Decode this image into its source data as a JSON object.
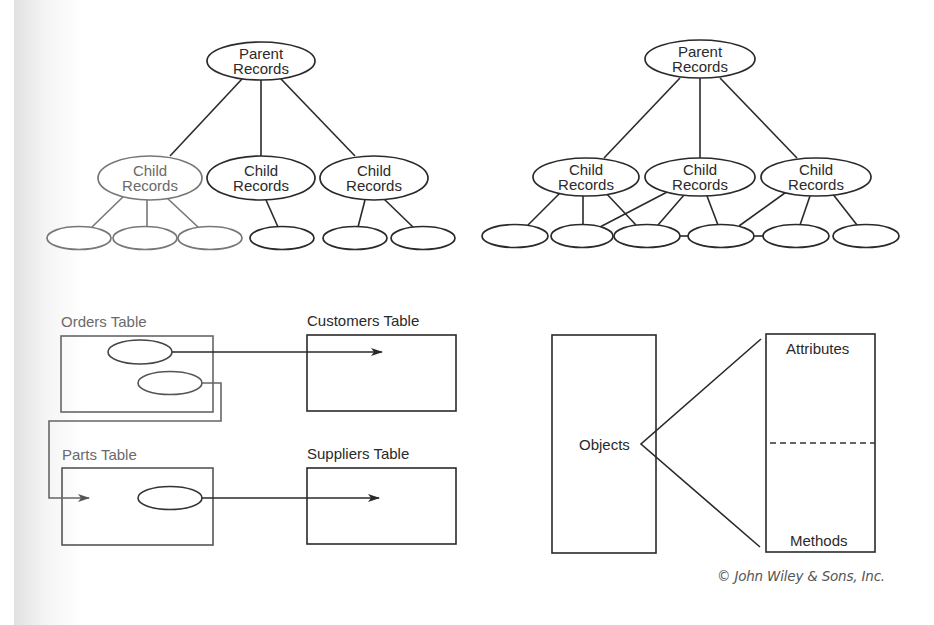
{
  "hierarchical_model": {
    "parent": {
      "line1": "Parent",
      "line2": "Records",
      "cx": 261,
      "cy": 61,
      "rx": 54,
      "ry": 19
    },
    "children": [
      {
        "line1": "Child",
        "line2": "Records",
        "cx": 150,
        "cy": 178,
        "rx": 52,
        "ry": 22
      },
      {
        "line1": "Child",
        "line2": "Records",
        "cx": 261,
        "cy": 178,
        "rx": 54,
        "ry": 22
      },
      {
        "line1": "Child",
        "line2": "Records",
        "cx": 374,
        "cy": 178,
        "rx": 54,
        "ry": 22
      }
    ],
    "leaves": [
      {
        "cx": 79,
        "cy": 238,
        "rx": 32,
        "ry": 11.5
      },
      {
        "cx": 145,
        "cy": 238,
        "rx": 32,
        "ry": 11.5
      },
      {
        "cx": 210,
        "cy": 238,
        "rx": 32,
        "ry": 11.5
      },
      {
        "cx": 282,
        "cy": 238,
        "rx": 32,
        "ry": 11.5
      },
      {
        "cx": 355,
        "cy": 238,
        "rx": 32,
        "ry": 11.5
      },
      {
        "cx": 423,
        "cy": 238,
        "rx": 32,
        "ry": 11.5
      }
    ],
    "edges": [
      [
        242,
        79,
        170,
        156
      ],
      [
        261,
        80,
        261,
        156
      ],
      [
        281,
        79,
        355,
        156
      ],
      [
        126,
        194,
        92,
        227
      ],
      [
        147,
        200,
        147,
        227
      ],
      [
        167,
        198,
        198,
        227
      ],
      [
        266,
        200,
        278,
        227
      ],
      [
        365,
        200,
        358,
        227
      ],
      [
        384,
        199,
        413,
        227
      ]
    ]
  },
  "network_model": {
    "parent": {
      "line1": "Parent",
      "line2": "Records",
      "cx": 700,
      "cy": 59,
      "rx": 55,
      "ry": 19
    },
    "children": [
      {
        "line1": "Child",
        "line2": "Records",
        "cx": 586,
        "cy": 177,
        "rx": 53,
        "ry": 19
      },
      {
        "line1": "Child",
        "line2": "Records",
        "cx": 700,
        "cy": 177,
        "rx": 55,
        "ry": 19
      },
      {
        "line1": "Child",
        "line2": "Records",
        "cx": 816,
        "cy": 177,
        "rx": 55,
        "ry": 19
      }
    ],
    "leaves": [
      {
        "cx": 515,
        "cy": 236,
        "rx": 33,
        "ry": 11.5
      },
      {
        "cx": 582,
        "cy": 236,
        "rx": 31,
        "ry": 11.5
      },
      {
        "cx": 647,
        "cy": 236,
        "rx": 33,
        "ry": 11.5
      },
      {
        "cx": 721,
        "cy": 236,
        "rx": 33,
        "ry": 11.5
      },
      {
        "cx": 796,
        "cy": 236,
        "rx": 33,
        "ry": 11.5
      },
      {
        "cx": 866,
        "cy": 236,
        "rx": 33,
        "ry": 11.5
      }
    ],
    "edges": [
      [
        680,
        78,
        604,
        158
      ],
      [
        700,
        78,
        700,
        158
      ],
      [
        720,
        78,
        797,
        158
      ],
      [
        563,
        190,
        528,
        225
      ],
      [
        583,
        196,
        583,
        225
      ],
      [
        604,
        191,
        636,
        225
      ],
      [
        671,
        190,
        600,
        227
      ],
      [
        684,
        195,
        658,
        225
      ],
      [
        707,
        196,
        718,
        225
      ],
      [
        789,
        190,
        739,
        226
      ],
      [
        810,
        196,
        800,
        225
      ],
      [
        832,
        193,
        857,
        225
      ],
      [
        680,
        236,
        688,
        236
      ],
      [
        754,
        236,
        763,
        236
      ]
    ]
  },
  "relational_model": {
    "orders_table": {
      "label": "Orders Table",
      "x": 61,
      "y": 336,
      "w": 152,
      "h": 76
    },
    "customers_table": {
      "label": "Customers Table",
      "x": 307,
      "y": 335,
      "w": 149,
      "h": 76
    },
    "parts_table": {
      "label": "Parts Table",
      "x": 62,
      "y": 468,
      "w": 151,
      "h": 77
    },
    "suppliers_table": {
      "label": "Suppliers Table",
      "x": 307,
      "y": 468,
      "w": 149,
      "h": 76
    },
    "keys": [
      {
        "cx": 140,
        "cy": 352,
        "rx": 32,
        "ry": 12
      },
      {
        "cx": 170,
        "cy": 383,
        "rx": 32,
        "ry": 11.5
      },
      {
        "cx": 170,
        "cy": 498,
        "rx": 32,
        "ry": 11.5
      }
    ]
  },
  "object_model": {
    "objects_box": {
      "label": "Objects",
      "x": 552,
      "y": 335,
      "w": 104,
      "h": 218
    },
    "class_box": {
      "x": 766,
      "y": 334,
      "w": 109,
      "h": 218
    },
    "attributes_label": "Attributes",
    "methods_label": "Methods"
  },
  "copyright": "© John Wiley & Sons, Inc."
}
